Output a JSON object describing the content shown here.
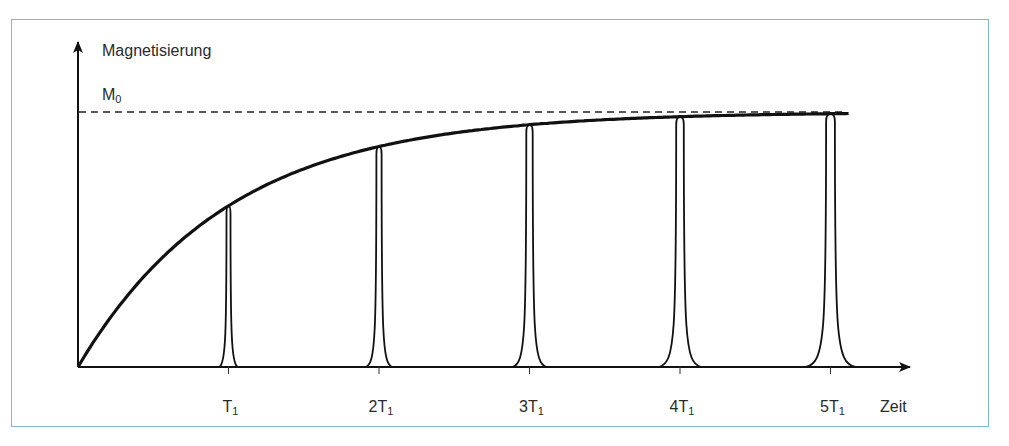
{
  "figure": {
    "frame_color": "#7fb8c9",
    "y_axis_label": "Magnetisierung",
    "asymptote_label": "M",
    "asymptote_sub": "0",
    "x_axis_label": "Zeit"
  },
  "chart_data": {
    "type": "line",
    "title": "",
    "xlabel": "Zeit",
    "ylabel": "Magnetisierung",
    "curve": "M(t) = M0 (1 - e^(-t/T1))",
    "asymptote": {
      "label": "M0",
      "style": "dashed"
    },
    "ticks": [
      {
        "label": "T",
        "sub": "1",
        "mult": "",
        "x_units": 1,
        "peak_fraction": 0.63
      },
      {
        "label": "T",
        "sub": "1",
        "mult": "2",
        "x_units": 2,
        "peak_fraction": 0.86
      },
      {
        "label": "T",
        "sub": "1",
        "mult": "3",
        "x_units": 3,
        "peak_fraction": 0.95
      },
      {
        "label": "T",
        "sub": "1",
        "mult": "4",
        "x_units": 4,
        "peak_fraction": 0.98
      },
      {
        "label": "T",
        "sub": "1",
        "mult": "5",
        "x_units": 5,
        "peak_fraction": 0.99
      }
    ],
    "x_range": [
      0,
      5.6
    ],
    "y_range": [
      0,
      1
    ]
  }
}
